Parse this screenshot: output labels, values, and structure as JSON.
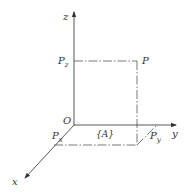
{
  "diagram": {
    "type": "3d-coordinate-frame",
    "frame_label": "{A}",
    "origin_label": "O",
    "axes": {
      "x": "x",
      "y": "y",
      "z": "z"
    },
    "point": {
      "label": "P",
      "projections": {
        "x": {
          "base": "P",
          "sub": "x"
        },
        "y": {
          "base": "P",
          "sub": "y"
        },
        "z": {
          "base": "P",
          "sub": "z"
        }
      }
    },
    "colors": {
      "line": "#444444",
      "text": "#333333",
      "background": "#ffffff"
    }
  }
}
